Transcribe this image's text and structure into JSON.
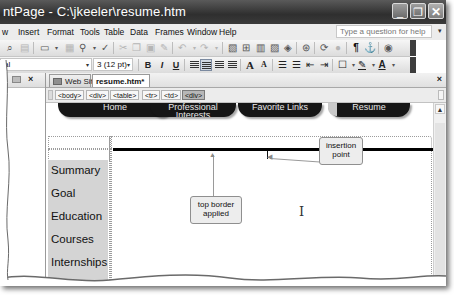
{
  "window": {
    "title": "ntPage - C:\\jkeeler\\resume.htm",
    "controls": {
      "minimize": "_",
      "restore": "❐",
      "close": "✕"
    }
  },
  "menubar": {
    "items": [
      {
        "label": "w"
      },
      {
        "label": "Insert"
      },
      {
        "label": "Format"
      },
      {
        "label": "Tools"
      },
      {
        "label": "Table"
      },
      {
        "label": "Data"
      },
      {
        "label": "Frames"
      },
      {
        "label": "Window"
      },
      {
        "label": "Help"
      }
    ],
    "help_placeholder": "Type a question for help",
    "help_dropdown": "▾"
  },
  "standard_toolbar": {
    "icons": [
      "binoculars",
      "print-preview",
      "view",
      "publish",
      "spelling",
      "spell-check",
      "cut",
      "copy",
      "paste",
      "format-painter",
      "undo",
      "redo",
      "insert-layer",
      "insert-table",
      "insert-frame",
      "insert-picture",
      "insert-drawing",
      "hyperlink",
      "refresh",
      "stop",
      "show-all",
      "bookmark",
      "help"
    ]
  },
  "formatting_toolbar": {
    "style_value": "al",
    "font_size_value": "3 (12 pt)",
    "bold": "B",
    "italic": "I",
    "underline": "U",
    "increase_font": "A",
    "decrease_font": "A",
    "dropdown": "▾"
  },
  "left_pane": {
    "close_label": "×"
  },
  "doc_tabs": {
    "tabs": [
      {
        "label": "Web Site",
        "active": false
      },
      {
        "label": "resume.htm*",
        "active": true
      }
    ],
    "close_label": "×"
  },
  "tag_selector": {
    "tags": [
      "<body>",
      "<div>",
      "<table>",
      "<tr>",
      "<td>",
      "<div>"
    ],
    "selected_index": 5
  },
  "page": {
    "nav_buttons": [
      "Home",
      "Professional Interests",
      "Favorite Links",
      "Resume"
    ],
    "side_items": [
      "Summary",
      "Goal",
      "Education",
      "Courses",
      "Internships"
    ]
  },
  "callouts": {
    "top_border": "top border applied",
    "top_border_line1": "top border",
    "top_border_line2": "applied",
    "insertion_line1": "insertion",
    "insertion_line2": "point"
  },
  "colors": {
    "title_bar": "#3a3a3a",
    "nav_button": "#161616",
    "side_cell": "#d4d4d4",
    "callout_bg": "#ededed"
  }
}
